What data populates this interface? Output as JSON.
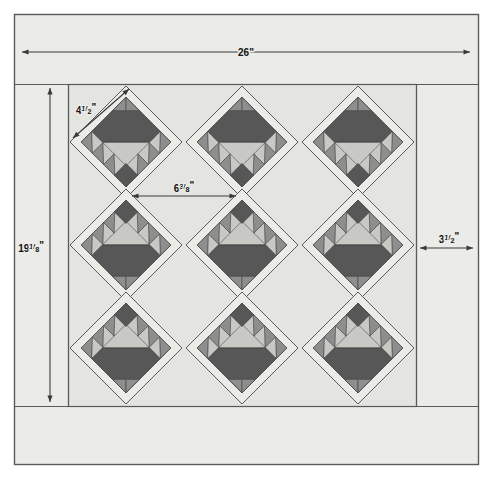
{
  "diagram": {
    "type": "quilt-assembly-diagram",
    "dimensions": {
      "width_label": "26\"",
      "height_label": "19",
      "height_frac_num": "1",
      "height_frac_den": "8",
      "height_unit": "\"",
      "block_label": "4",
      "block_frac_num": "1",
      "block_frac_den": "2",
      "block_unit": "\"",
      "setting_label": "6",
      "setting_frac_num": "3",
      "setting_frac_den": "8",
      "setting_unit": "\"",
      "border_label": "3",
      "border_frac_num": "1",
      "border_frac_den": "2",
      "border_unit": "\""
    },
    "colors": {
      "page_background": "#ffffff",
      "quilt_background": "#ebebe7",
      "block_background": "#e4e4e0",
      "dark_fabric": "#575757",
      "medium_fabric": "#8e8e8e",
      "light_fabric": "#c8c8c4",
      "outline": "#4a4a4a",
      "dimension_line": "#3a3a3a",
      "frame_border": "#5a5a5a"
    },
    "layout": {
      "rows": 3,
      "columns": 3,
      "block_count": 9,
      "block_orientation_by_row": [
        "upright",
        "inverted",
        "inverted"
      ],
      "sawtooth_per_edge": 4
    }
  },
  "chart_data": {
    "type": "diagram",
    "annotations": [
      {
        "name": "overall-width",
        "label": "26\"",
        "orientation": "horizontal",
        "position": "top"
      },
      {
        "name": "overall-height",
        "label": "19 1/8\"",
        "orientation": "vertical",
        "position": "left"
      },
      {
        "name": "block-size",
        "label": "4 1/2\"",
        "orientation": "diagonal",
        "position": "upper-left-block"
      },
      {
        "name": "setting-size",
        "label": "6 3/8\"",
        "orientation": "horizontal",
        "position": "center-upper"
      },
      {
        "name": "border-width",
        "label": "3 1/2\"",
        "orientation": "horizontal",
        "position": "right"
      }
    ]
  }
}
